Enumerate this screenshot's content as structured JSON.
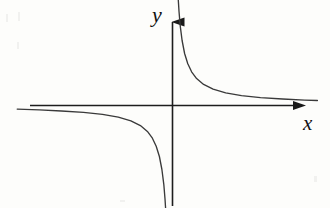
{
  "figure": {
    "kind": "math-graph",
    "background_color": "#fdfdfb",
    "line_color": "#2b2b2b",
    "width": 330,
    "height": 208,
    "x_axis_label": "x",
    "y_axis_label": "y",
    "origin_x": 172,
    "origin_y": 105
  },
  "chart_data": {
    "type": "line",
    "title": "",
    "subtitle": "",
    "xlabel": "x",
    "ylabel": "y",
    "function": "y = k / x",
    "grid": false,
    "legend": null,
    "legend_position": "none",
    "xlim": [
      -5.0,
      5.0
    ],
    "ylim": [
      -5.0,
      5.0
    ],
    "xticks": [],
    "yticks": [],
    "xticklabels": [],
    "yticklabels": [],
    "axes": {
      "x_axis_arrow": true,
      "y_axis_arrow": true,
      "x_axis_from": -4.9,
      "x_axis_to": 4.6,
      "y_axis_from": -4.9,
      "y_axis_to": 4.6
    },
    "asymptotes": [
      {
        "name": "horizontal-asymptote",
        "equation": "y = 0"
      },
      {
        "name": "vertical-asymptote",
        "equation": "x = 0"
      }
    ],
    "series": [
      {
        "name": "branch-quadrant-I",
        "quadrant": 1,
        "x": [
          0.18,
          0.22,
          0.26,
          0.32,
          0.4,
          0.5,
          0.62,
          0.78,
          1.0,
          1.3,
          1.7,
          2.2,
          2.8,
          3.5,
          4.2,
          4.6
        ],
        "y": [
          5.56,
          4.55,
          3.85,
          3.13,
          2.5,
          2.0,
          1.61,
          1.28,
          1.0,
          0.77,
          0.59,
          0.45,
          0.36,
          0.29,
          0.24,
          0.22
        ]
      },
      {
        "name": "branch-quadrant-III",
        "quadrant": 3,
        "x": [
          -4.9,
          -4.2,
          -3.5,
          -2.8,
          -2.2,
          -1.7,
          -1.3,
          -1.0,
          -0.78,
          -0.62,
          -0.5,
          -0.4,
          -0.32,
          -0.26,
          -0.22,
          -0.18
        ],
        "y": [
          -0.2,
          -0.24,
          -0.29,
          -0.36,
          -0.45,
          -0.59,
          -0.77,
          -1.0,
          -1.28,
          -1.61,
          -2.0,
          -2.5,
          -3.13,
          -3.85,
          -4.55,
          -5.56
        ]
      }
    ]
  }
}
